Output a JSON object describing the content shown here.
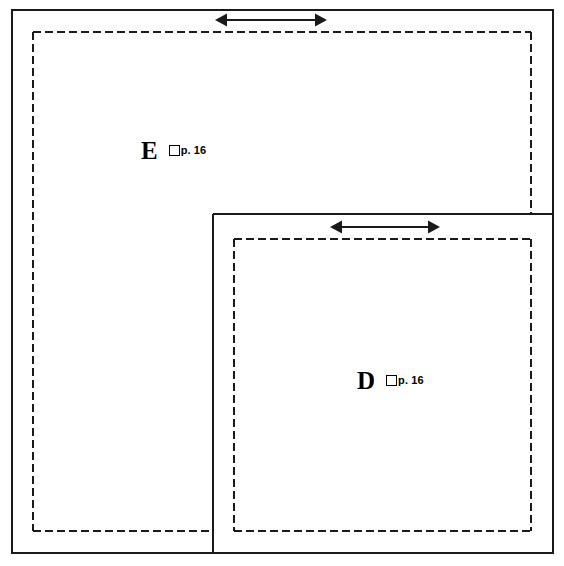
{
  "diagram": {
    "type": "nested-region-diagram",
    "title": "",
    "background_color": "#ffffff",
    "stroke_color": "#1a1a1a",
    "canvas": {
      "width": 564,
      "height": 566
    },
    "regions": [
      {
        "id": "region-e",
        "letter": "E",
        "page_label": "p. 16",
        "checkbox_checked": false,
        "outer_solid_rect": {
          "x": 12,
          "y": 10,
          "width": 541,
          "height": 543
        },
        "inner_dashed_rect": {
          "x": 33,
          "y": 32,
          "width": 498,
          "height": 499
        }
      },
      {
        "id": "region-d",
        "letter": "D",
        "page_label": "p. 16",
        "checkbox_checked": false,
        "outer_solid_rect": {
          "x": 213,
          "y": 214,
          "width": 340,
          "height": 339
        },
        "inner_dashed_rect": {
          "x": 234,
          "y": 239,
          "width": 297,
          "height": 292
        }
      }
    ],
    "arrows": [
      {
        "id": "arrow-margin-e",
        "style": "double-headed",
        "orientation": "horizontal",
        "x1": 215,
        "x2": 327,
        "y": 20
      },
      {
        "id": "arrow-margin-d",
        "style": "double-headed",
        "orientation": "horizontal",
        "x1": 330,
        "x2": 440,
        "y": 227
      }
    ],
    "labels": {
      "e": {
        "letter": "E",
        "page": "p. 16"
      },
      "d": {
        "letter": "D",
        "page": "p. 16"
      }
    }
  }
}
